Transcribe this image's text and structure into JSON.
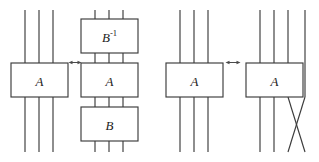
{
  "figure": {
    "background_color": "#ffffff",
    "stroke_color": "#3b3b3b",
    "label_color": "#222222",
    "width": 319,
    "height": 162
  },
  "relations": [
    {
      "id": "relation-1",
      "left_side": {
        "id": "group-1",
        "strand_count": 3,
        "gates": [
          {
            "id": "gate-a-1",
            "label": "A",
            "superscript": ""
          }
        ]
      },
      "connector": {
        "id": "equivalence-arrow-1",
        "glyph": "↔",
        "name": "double-headed-arrow"
      },
      "right_side": {
        "id": "group-2",
        "strand_count": 3,
        "gates": [
          {
            "id": "gate-binv-2",
            "label": "B",
            "superscript": "-1"
          },
          {
            "id": "gate-a-2",
            "label": "A",
            "superscript": ""
          },
          {
            "id": "gate-b-2",
            "label": "B",
            "superscript": ""
          }
        ]
      }
    },
    {
      "id": "relation-2",
      "left_side": {
        "id": "group-3",
        "strand_count": 3,
        "gates": [
          {
            "id": "gate-a-3",
            "label": "A",
            "superscript": ""
          }
        ]
      },
      "connector": {
        "id": "equivalence-arrow-2",
        "glyph": "↔",
        "name": "double-headed-arrow"
      },
      "right_side": {
        "id": "group-4",
        "strand_count": 4,
        "gates": [
          {
            "id": "gate-a-4",
            "label": "A",
            "superscript": ""
          }
        ],
        "crossing": {
          "id": "strand-crossing-4",
          "name": "strand-crossing",
          "strands": [
            3,
            4
          ]
        }
      }
    }
  ]
}
